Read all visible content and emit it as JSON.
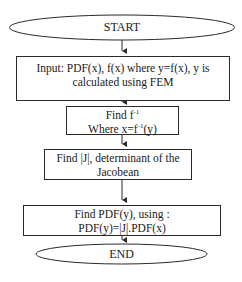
{
  "flowchart": {
    "start": {
      "label": "START"
    },
    "input": {
      "line1": "Input: PDF(x), f(x) where y=f(x), y is",
      "line2": "calculated using FEM"
    },
    "inverse": {
      "line1_prefix": "Find f",
      "line1_sup": "-1",
      "line2_prefix": "Where x=f",
      "line2_sup": "-1",
      "line2_suffix": "(y)"
    },
    "jacobian": {
      "line1": "Find |J|, determinant of the",
      "line2": "Jacobean"
    },
    "pdf_y": {
      "line1": "Find PDF(y), using :",
      "line2": "PDF(y)=|J|.PDF(x)"
    },
    "end": {
      "label": "END"
    }
  },
  "colors": {
    "stroke": "#2a2a2a",
    "background": "#ffffff",
    "text": "#1a1a1a"
  }
}
